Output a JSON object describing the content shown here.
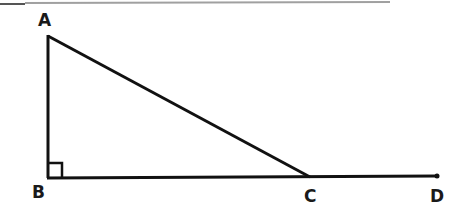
{
  "diagram": {
    "type": "geometry-figure",
    "points": {
      "A": {
        "label": "A",
        "x": 48,
        "y": 35
      },
      "B": {
        "label": "B",
        "x": 48,
        "y": 178
      },
      "C": {
        "label": "C",
        "x": 310,
        "y": 177
      },
      "D": {
        "label": "D",
        "x": 437,
        "y": 176
      }
    },
    "segments": [
      {
        "from": "A",
        "to": "B"
      },
      {
        "from": "A",
        "to": "C"
      },
      {
        "from": "B",
        "to": "D"
      }
    ],
    "right_angle_marker": {
      "at": "B",
      "size": 14
    },
    "endpoint_dot": "D",
    "stroke_color": "#111111",
    "top_rule_color": "#9a9a9a"
  }
}
